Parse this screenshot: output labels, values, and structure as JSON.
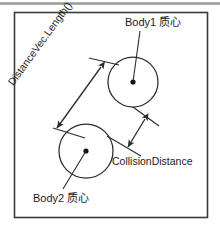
{
  "figure": {
    "background_color": "#ffffff",
    "border_color": "#3a3a3a",
    "stroke_color": "#2b2b2b",
    "text_color": "#1c1c1c",
    "top_rule_color": "#9a9a9a"
  },
  "labels": {
    "body1": "Body1 质心",
    "body2": "Body2 质心",
    "collision_distance": "CollisionDistance",
    "distance_vec": "DistanceVec.Length()"
  },
  "shapes": {
    "body1_circle": {
      "cx": 133,
      "cy": 82,
      "r": 25
    },
    "body2_circle": {
      "cx": 86,
      "cy": 151,
      "r": 27
    },
    "body1_center_dot": {
      "cx": 133,
      "cy": 82,
      "r": 2.6
    },
    "body2_center_dot": {
      "cx": 86,
      "cy": 151,
      "r": 2.6
    }
  },
  "arrows": {
    "distance_vec_arrow": {
      "x1": 101,
      "y1": 67,
      "x2": 57,
      "y2": 128,
      "heads": "both"
    },
    "collision_distance_arrow": {
      "x1": 144,
      "y1": 120,
      "x2": 128,
      "y2": 146,
      "heads": "both"
    }
  },
  "leader_lines": {
    "body1_label_to_center": {
      "x1": 140,
      "y1": 31,
      "x2": 133,
      "y2": 82
    },
    "body2_label_to_center": {
      "x1": 63,
      "y1": 189,
      "x2": 86,
      "y2": 151
    },
    "body1_tangent_upper": {
      "x1": 89,
      "y1": 58,
      "x2": 118,
      "y2": 64
    },
    "body2_tangent_upper": {
      "x1": 54,
      "y1": 128,
      "x2": 84,
      "y2": 137
    },
    "collision_leader_top": {
      "x1": 133,
      "y1": 107,
      "x2": 158,
      "y2": 125
    },
    "collision_leader_bottom": {
      "x1": 108,
      "y1": 136,
      "x2": 140,
      "y2": 155
    }
  },
  "frame": {
    "x": 14,
    "y": 12,
    "width": 194,
    "height": 206
  }
}
